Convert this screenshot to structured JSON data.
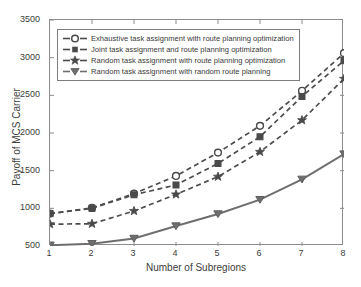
{
  "chart_data": {
    "type": "line",
    "title": "",
    "xlabel": "Number of Subregions",
    "ylabel": "Payoff of MCS Carrier",
    "x": [
      1,
      2,
      3,
      4,
      5,
      6,
      7,
      8
    ],
    "xlim": [
      1,
      8
    ],
    "ylim": [
      500,
      3500
    ],
    "xticks": [
      "1",
      "2",
      "3",
      "4",
      "5",
      "6",
      "7",
      "8"
    ],
    "yticks": [
      "500",
      "1000",
      "1500",
      "2000",
      "2500",
      "3000",
      "3500"
    ],
    "grid": false,
    "legend_position": "upper left",
    "series": [
      {
        "name": "Exhaustive task assignment with route planning optimization",
        "marker": "circle-open",
        "linestyle": "dashed",
        "color": "#4d4d4d",
        "values": [
          930,
          1005,
          1195,
          1430,
          1740,
          2095,
          2560,
          3060
        ]
      },
      {
        "name": "Joint task assignment and route planning optimization",
        "marker": "square-filled",
        "linestyle": "dashed",
        "color": "#4d4d4d",
        "values": [
          930,
          1000,
          1180,
          1310,
          1595,
          1950,
          2485,
          2960
        ]
      },
      {
        "name": "Random task assignment with route planning optimization",
        "marker": "star-filled",
        "linestyle": "dashed",
        "color": "#4d4d4d",
        "values": [
          790,
          795,
          965,
          1185,
          1420,
          1750,
          2170,
          2720
        ]
      },
      {
        "name": "Random task assignment with random route planning",
        "marker": "triangle-down-filled",
        "linestyle": "solid",
        "color": "#6e6e6e",
        "values": [
          510,
          530,
          600,
          765,
          925,
          1115,
          1385,
          1720
        ]
      }
    ]
  },
  "axes": {
    "y_title": "Payoff of MCS Carrier",
    "x_title": "Number of Subregions",
    "y_tick_labels": [
      "3500",
      "3000",
      "2500",
      "2000",
      "1500",
      "1000",
      "500"
    ],
    "x_tick_labels": [
      "1",
      "2",
      "3",
      "4",
      "5",
      "6",
      "7",
      "8"
    ]
  },
  "legend": {
    "items": [
      {
        "label": "Exhaustive task assignment with route planning optimization"
      },
      {
        "label": "Joint task assignment and route planning optimization"
      },
      {
        "label": "Random task assignment with route planning optimization"
      },
      {
        "label": "Random task assignment with random route planning"
      }
    ]
  },
  "colors": {
    "line_dark": "#4d4d4d",
    "line_solid": "#6e6e6e",
    "axis": "#8c8c8c",
    "text": "#3a3a3a",
    "background": "#ffffff"
  }
}
